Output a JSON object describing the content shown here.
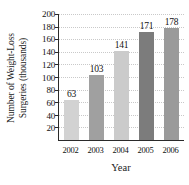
{
  "chart_data": {
    "type": "bar",
    "title": "",
    "xlabel": "Year",
    "ylabel": "Number of Weight-Loss Surgeries (thousands)",
    "ylabel_line1": "Number of Weight-Loss",
    "ylabel_line2": "Surgeries (thousands)",
    "categories": [
      "2002",
      "2003",
      "2004",
      "2005",
      "2006"
    ],
    "values": [
      63,
      103,
      141,
      171,
      178
    ],
    "value_labels": [
      "63",
      "103",
      "141",
      "171",
      "178"
    ],
    "ylim": [
      0,
      200
    ],
    "ytick_step": 20,
    "ytick_labels": [
      "200",
      "180",
      "160",
      "140",
      "120",
      "100",
      "80",
      "60",
      "40",
      "20"
    ],
    "ytick_values": [
      200,
      180,
      160,
      140,
      120,
      100,
      80,
      60,
      40,
      20
    ],
    "grid": true,
    "legend": false,
    "bar_colors": [
      "#d2d2d2",
      "#a0a0a0",
      "#cbcbcb",
      "#7c7c7c",
      "#9a9a9a"
    ],
    "axis_color": "#2a2a2a",
    "gridline_color": "#c9c9c9",
    "text_color": "#111111"
  }
}
